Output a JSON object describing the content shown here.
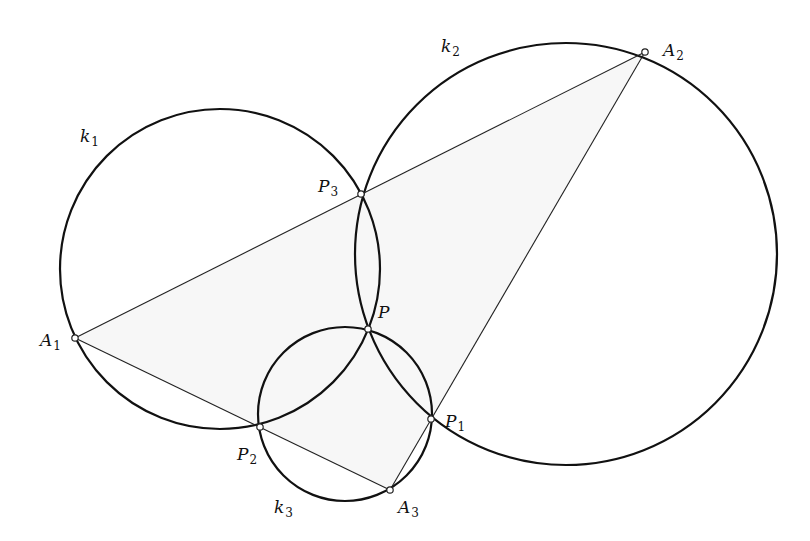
{
  "figure": {
    "circles": [
      {
        "name": "k1",
        "label": "k",
        "sub": "1",
        "cx": 220,
        "cy": 269,
        "r": 160,
        "lx": 80,
        "ly": 142
      },
      {
        "name": "k2",
        "label": "k",
        "sub": "2",
        "cx": 566,
        "cy": 254,
        "r": 211,
        "lx": 441,
        "ly": 52
      },
      {
        "name": "k3",
        "label": "k",
        "sub": "3",
        "cx": 345,
        "cy": 414,
        "r": 87,
        "lx": 274,
        "ly": 513
      }
    ],
    "points": [
      {
        "name": "A1",
        "label": "A",
        "sub": "1",
        "x": 75,
        "y": 338,
        "lx": 40,
        "ly": 346
      },
      {
        "name": "A2",
        "label": "A",
        "sub": "2",
        "x": 645,
        "y": 52,
        "lx": 663,
        "ly": 56
      },
      {
        "name": "A3",
        "label": "A",
        "sub": "3",
        "x": 390,
        "y": 490,
        "lx": 398,
        "ly": 513
      },
      {
        "name": "P1",
        "label": "P",
        "sub": "1",
        "x": 431,
        "y": 419,
        "lx": 445,
        "ly": 427
      },
      {
        "name": "P2",
        "label": "P",
        "sub": "2",
        "x": 260,
        "y": 427,
        "lx": 237,
        "ly": 460
      },
      {
        "name": "P3",
        "label": "P",
        "sub": "3",
        "x": 361,
        "y": 194,
        "lx": 318,
        "ly": 192
      },
      {
        "name": "P",
        "label": "P",
        "sub": "",
        "x": 368,
        "y": 329,
        "lx": 378,
        "ly": 318
      }
    ],
    "segments": [
      {
        "name": "A1-A2",
        "from": "A1",
        "to": "A2"
      },
      {
        "name": "A2-A3",
        "from": "A2",
        "to": "A3"
      },
      {
        "name": "A1-A3",
        "from": "A1",
        "to": "A3"
      }
    ]
  }
}
